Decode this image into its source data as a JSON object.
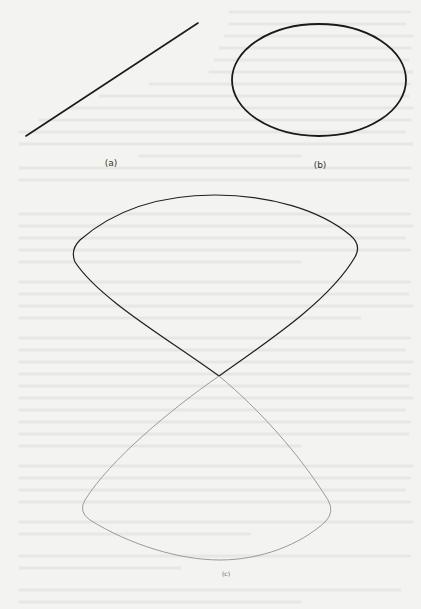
{
  "figure": {
    "panels": [
      {
        "id": "a",
        "label": "(a)",
        "shape": "straight-line",
        "geometry": {
          "x1": 26,
          "y1": 136,
          "x2": 198,
          "y2": 23
        },
        "label_pos": {
          "x": 111,
          "y": 163
        }
      },
      {
        "id": "b",
        "label": "(b)",
        "shape": "ellipse",
        "geometry": {
          "cx": 319,
          "cy": 80,
          "rx": 87,
          "ry": 56
        },
        "label_pos": {
          "x": 320,
          "y": 165
        }
      },
      {
        "id": "c",
        "label": "(c)",
        "shape": "figure-eight-curve",
        "geometry": {
          "upper_lobe": {
            "left_cusp": [
              73,
              250
            ],
            "right_cusp": [
              358,
              245
            ],
            "top": [
              215,
              195
            ]
          },
          "crossing": [
            219,
            376
          ],
          "lower_lobe": {
            "left_cusp": [
              80,
              515
            ],
            "right_cusp": [
              330,
              510
            ],
            "bottom": [
              220,
              560
            ]
          }
        },
        "label_pos": {
          "x": 226,
          "y": 573
        }
      }
    ],
    "colors": {
      "background": "#f3f3f1",
      "stroke_dark": "#1a1a1a",
      "stroke_light": "#9a9a9a",
      "bleed_text": "#e6e6e3"
    }
  }
}
